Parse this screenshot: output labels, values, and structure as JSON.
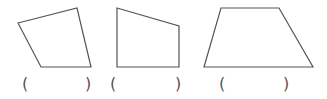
{
  "stroke_color": "#555555",
  "figures": [
    {
      "label": "quadrilateral-1",
      "points": "18,23 77,8 91,67 41,67",
      "answer": "",
      "open_paren": "(",
      "close_paren": ")"
    },
    {
      "label": "right-trapezoid",
      "points": "117,8 179,26 179,67 117,67",
      "answer": "",
      "open_paren": "(",
      "close_paren": ")"
    },
    {
      "label": "trapezoid",
      "points": "221,8 279,8 313,67 204,67",
      "answer": "",
      "open_paren": "(",
      "close_paren": ")"
    }
  ]
}
